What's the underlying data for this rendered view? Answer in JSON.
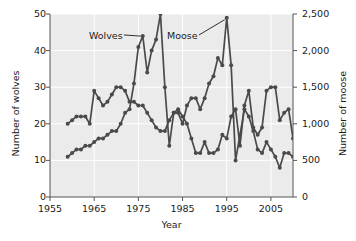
{
  "chart_data": {
    "type": "line",
    "title": "",
    "xlabel": "Year",
    "ylabel": "Number of wolves",
    "y2label": "Number of moose",
    "xlim": [
      1955,
      2010
    ],
    "xticks": [
      1955,
      1965,
      1975,
      1985,
      1995,
      2005
    ],
    "xticklabels": [
      "1955",
      "1965",
      "1975",
      "1985",
      "1995",
      "2005"
    ],
    "ylim": [
      0,
      50
    ],
    "yticks": [
      0,
      10,
      20,
      30,
      40,
      50
    ],
    "yticklabels": [
      "0",
      "10",
      "20",
      "30",
      "40",
      "50"
    ],
    "y2lim": [
      0,
      2500
    ],
    "y2ticks": [
      0,
      500,
      1000,
      1500,
      2000,
      2500
    ],
    "y2ticklabels": [
      "0",
      "500",
      "1,000",
      "1,500",
      "2,000",
      "2,500"
    ],
    "grid": true,
    "legend_position": "inline-annotations",
    "annotations": [
      {
        "text": "Wolves",
        "x": 1971.5,
        "y": 44.0,
        "points_to_x": 1976,
        "points_to_y": 44.5
      },
      {
        "text": "Moose",
        "x": 1988.5,
        "y": 44.0,
        "points_to_x": 1995,
        "points_to_y": 49.0
      }
    ],
    "marker": "circle",
    "series": [
      {
        "name": "Wolves",
        "axis": "left",
        "units": "wolves",
        "color": "#4a4a4a",
        "x": [
          1959,
          1960,
          1961,
          1962,
          1963,
          1964,
          1965,
          1966,
          1967,
          1968,
          1969,
          1970,
          1971,
          1972,
          1973,
          1974,
          1975,
          1976,
          1977,
          1978,
          1979,
          1980,
          1981,
          1982,
          1983,
          1984,
          1985,
          1986,
          1987,
          1988,
          1989,
          1990,
          1991,
          1992,
          1993,
          1994,
          1995,
          1996,
          1997,
          1998,
          1999,
          2000,
          2001,
          2002,
          2003,
          2004,
          2005,
          2006,
          2007,
          2008,
          2009,
          2010
        ],
        "values": [
          11,
          12,
          13,
          13,
          14,
          14,
          15,
          16,
          16,
          17,
          18,
          18,
          20,
          23,
          24,
          31,
          41,
          44,
          34,
          40,
          43,
          50,
          30,
          14,
          23,
          24,
          22,
          20,
          16,
          12,
          12,
          15,
          12,
          12,
          13,
          17,
          16,
          22,
          24,
          14,
          25,
          29,
          19,
          17,
          19,
          29,
          30,
          30,
          21,
          23,
          24,
          16
        ]
      },
      {
        "name": "Moose",
        "axis": "right",
        "units": "moose",
        "color": "#4a4a4a",
        "x": [
          1959,
          1960,
          1961,
          1962,
          1963,
          1964,
          1965,
          1966,
          1967,
          1968,
          1969,
          1970,
          1971,
          1972,
          1973,
          1974,
          1975,
          1976,
          1977,
          1978,
          1979,
          1980,
          1981,
          1982,
          1983,
          1984,
          1985,
          1986,
          1987,
          1988,
          1989,
          1990,
          1991,
          1992,
          1993,
          1994,
          1995,
          1996,
          1997,
          1998,
          1999,
          2000,
          2001,
          2002,
          2003,
          2004,
          2005,
          2006,
          2007,
          2008,
          2009,
          2010
        ],
        "values_wolfscale": [
          20,
          21,
          22,
          22,
          22,
          20,
          29,
          27,
          25,
          26,
          28,
          30,
          30,
          29,
          26,
          26,
          25,
          25,
          23,
          21,
          19,
          18,
          18,
          21,
          23,
          23,
          20,
          25,
          27,
          27,
          24,
          27,
          31,
          33,
          38,
          36,
          49,
          36,
          10,
          17,
          24,
          22,
          18,
          13,
          12,
          15,
          13,
          11,
          8,
          12,
          12,
          11
        ],
        "values_moose": [
          1000,
          1050,
          1100,
          1100,
          1100,
          1000,
          1450,
          1350,
          1250,
          1300,
          1400,
          1500,
          1500,
          1450,
          1300,
          1300,
          1250,
          1250,
          1150,
          1050,
          950,
          900,
          900,
          1050,
          1150,
          1150,
          1000,
          1250,
          1350,
          1350,
          1200,
          1350,
          1550,
          1650,
          1900,
          1800,
          2450,
          1800,
          500,
          850,
          1200,
          1100,
          900,
          650,
          600,
          750,
          650,
          550,
          400,
          600,
          600,
          550
        ]
      }
    ]
  }
}
